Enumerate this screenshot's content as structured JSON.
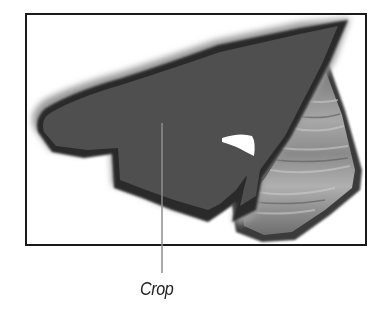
{
  "diagram": {
    "callouts": [
      {
        "label": "Crop",
        "target": "dark-cropped-region"
      }
    ],
    "colors": {
      "frame": "#1a1a1a",
      "crop_fill": "#4f4f4f",
      "crop_border": "#2a2a2a",
      "shadow": "#9a9a9a",
      "uncropped_texture": "#8a8a8a",
      "leader_line": "#8c8c8c",
      "background": "#ffffff"
    }
  }
}
